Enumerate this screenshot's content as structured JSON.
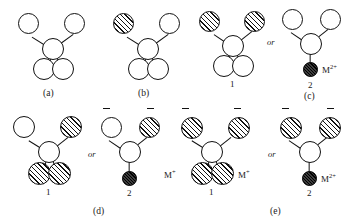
{
  "figure": {
    "panels": [
      {
        "id": "a",
        "label": "(a)",
        "structures": [
          {
            "number": "",
            "atoms": [
              {
                "name": "top-left-atom",
                "fill": "open"
              },
              {
                "name": "top-right-atom",
                "fill": "open"
              },
              {
                "name": "center-atom",
                "fill": "open"
              },
              {
                "name": "bottom-left-atom",
                "fill": "open"
              },
              {
                "name": "bottom-right-atom",
                "fill": "open"
              }
            ],
            "charges": [],
            "counterions": []
          }
        ],
        "or_label": ""
      },
      {
        "id": "b",
        "label": "(b)",
        "structures": [
          {
            "number": "",
            "atoms": [
              {
                "name": "top-left-atom",
                "fill": "hatch"
              },
              {
                "name": "top-right-atom",
                "fill": "open"
              },
              {
                "name": "center-atom",
                "fill": "open"
              },
              {
                "name": "bottom-left-atom",
                "fill": "open"
              },
              {
                "name": "bottom-right-atom",
                "fill": "open"
              }
            ],
            "charges": [],
            "counterions": []
          }
        ],
        "or_label": ""
      },
      {
        "id": "c",
        "label": "(c)",
        "or_label": "or",
        "structures": [
          {
            "number": "1",
            "atoms": [
              {
                "name": "top-left-atom",
                "fill": "hatch"
              },
              {
                "name": "top-right-atom",
                "fill": "hatch"
              },
              {
                "name": "center-atom",
                "fill": "open"
              },
              {
                "name": "bottom-left-atom",
                "fill": "open"
              },
              {
                "name": "bottom-right-atom",
                "fill": "open"
              }
            ],
            "charges": [],
            "counterions": []
          },
          {
            "number": "2",
            "atoms": [
              {
                "name": "top-left-atom",
                "fill": "open"
              },
              {
                "name": "top-right-atom",
                "fill": "open"
              },
              {
                "name": "center-atom",
                "fill": "open"
              },
              {
                "name": "bottom-atom",
                "fill": "filled"
              }
            ],
            "charges": [],
            "counterions": [
              "M2+"
            ]
          }
        ]
      },
      {
        "id": "d",
        "label": "(d)",
        "or_label": "or",
        "structures": [
          {
            "number": "1",
            "atoms": [
              {
                "name": "top-left-atom",
                "fill": "open"
              },
              {
                "name": "top-right-atom",
                "fill": "hatch"
              },
              {
                "name": "center-atom",
                "fill": "open"
              },
              {
                "name": "bottom-left-atom",
                "fill": "hatch"
              },
              {
                "name": "bottom-right-atom",
                "fill": "hatch"
              }
            ],
            "charges": [],
            "counterions": []
          },
          {
            "number": "2",
            "atoms": [
              {
                "name": "top-left-atom",
                "fill": "open"
              },
              {
                "name": "top-right-atom",
                "fill": "hatch"
              },
              {
                "name": "center-atom",
                "fill": "open"
              },
              {
                "name": "bottom-atom",
                "fill": "filled"
              }
            ],
            "charges": [
              "minus-top-left",
              "minus-top-right"
            ],
            "counterions": []
          }
        ]
      },
      {
        "id": "e",
        "label": "(e)",
        "or_label": "or",
        "structures": [
          {
            "number": "1",
            "atoms": [
              {
                "name": "top-left-atom",
                "fill": "hatch"
              },
              {
                "name": "top-right-atom",
                "fill": "hatch"
              },
              {
                "name": "center-atom",
                "fill": "open"
              },
              {
                "name": "bottom-left-atom",
                "fill": "hatch"
              },
              {
                "name": "bottom-right-atom",
                "fill": "hatch"
              }
            ],
            "charges": [
              "minus-top-left",
              "minus-top-right"
            ],
            "counterions": [
              "M+",
              "M+"
            ]
          },
          {
            "number": "2",
            "atoms": [
              {
                "name": "top-left-atom",
                "fill": "hatch"
              },
              {
                "name": "top-right-atom",
                "fill": "hatch"
              },
              {
                "name": "center-atom",
                "fill": "open"
              },
              {
                "name": "bottom-atom",
                "fill": "filled"
              }
            ],
            "charges": [
              "minus-top-left",
              "minus-top-right"
            ],
            "counterions": [
              "M2+"
            ]
          }
        ]
      }
    ],
    "ion_labels": {
      "m_divalent_base": "M",
      "m_divalent_sup": "2+",
      "m_monovalent_base": "M",
      "m_monovalent_sup": "+"
    }
  }
}
